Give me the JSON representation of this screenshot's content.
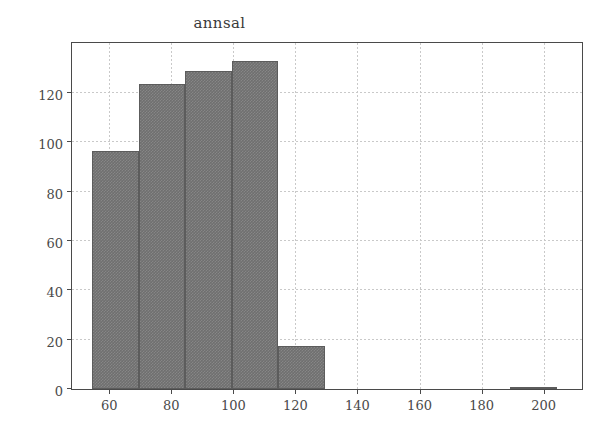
{
  "chart_data": {
    "type": "bar",
    "title": "annsal",
    "subtitle": "",
    "xlabel": "",
    "ylabel": "",
    "xlim": [
      48,
      213
    ],
    "ylim": [
      0,
      141
    ],
    "grid": true,
    "legend": null,
    "legend_position": "none",
    "bar_color": "#6f6f6f",
    "edge_color": "#5c5c5c",
    "grid_color": "#c9c9c9",
    "axis_color": "#4a4a4a",
    "background": "#ffffff",
    "bin_edges": [
      54.4,
      69.5,
      84.3,
      99.5,
      114.5,
      129.5,
      144.5,
      159.5,
      174.5,
      189.3,
      204.3
    ],
    "values": [
      96.5,
      123.5,
      129,
      133,
      17.5,
      0,
      0,
      0,
      0,
      1
    ],
    "bars": [
      {
        "x0": 54.4,
        "x1": 69.5,
        "height": 96.5
      },
      {
        "x0": 69.5,
        "x1": 84.3,
        "height": 123.5
      },
      {
        "x0": 84.3,
        "x1": 99.5,
        "height": 129
      },
      {
        "x0": 99.5,
        "x1": 114.5,
        "height": 133
      },
      {
        "x0": 114.5,
        "x1": 129.5,
        "height": 17.5
      },
      {
        "x0": 189.3,
        "x1": 204.3,
        "height": 1
      }
    ],
    "x_ticks": [
      60,
      80,
      100,
      120,
      140,
      160,
      180,
      200
    ],
    "x_tick_labels": [
      "60",
      "80",
      "100",
      "120",
      "140",
      "160",
      "180",
      "200"
    ],
    "y_ticks": [
      0,
      20,
      40,
      60,
      80,
      100,
      120
    ],
    "y_tick_labels": [
      "0",
      "20",
      "40",
      "60",
      "80",
      "100",
      "120"
    ]
  }
}
